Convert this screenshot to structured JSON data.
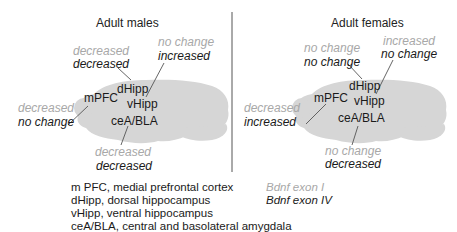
{
  "panels": [
    {
      "title": "Adult males",
      "regions": {
        "dHipp": {
          "label": "dHipp",
          "exon1": "decreased",
          "exon4": "decreased"
        },
        "vHipp": {
          "label": "vHipp",
          "exon1": "no change",
          "exon4": "increased"
        },
        "mPFC": {
          "label": "mPFC",
          "exon1": "decreased",
          "exon4": "no change"
        },
        "ceABLA": {
          "label": "ceA/BLA",
          "exon1": "decreased",
          "exon4": "decreased"
        }
      }
    },
    {
      "title": "Adult females",
      "regions": {
        "dHipp": {
          "label": "dHipp",
          "exon1": "no change",
          "exon4": "no change"
        },
        "vHipp": {
          "label": "vHipp",
          "exon1": "increased",
          "exon4": "no change"
        },
        "mPFC": {
          "label": "mPFC",
          "exon1": "decreased",
          "exon4": "increased"
        },
        "ceABLA": {
          "label": "ceA/BLA",
          "exon1": "no change",
          "exon4": "decreased"
        }
      }
    }
  ],
  "abbreviations": [
    "m PFC, medial prefrontal cortex",
    "dHipp, dorsal hippocampus",
    "vHipp, ventral hippocampus",
    "ceA/BLA, central and basolateral amygdala"
  ],
  "key": {
    "exon1": "Bdnf exon I",
    "exon4": "Bdnf exon IV"
  },
  "colors": {
    "brain": "#d6d6d6",
    "exon1_text": "#a8a8a8",
    "exon4_text": "#1a1a1a",
    "leader_line": "#555555",
    "divider": "#555555"
  }
}
